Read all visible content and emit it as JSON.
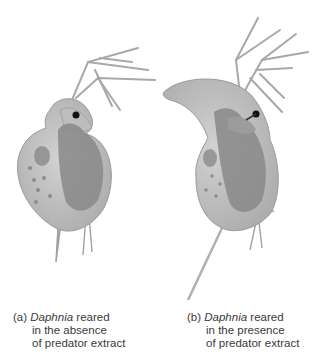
{
  "figure": {
    "panels": [
      {
        "id": "a",
        "label": "(a)",
        "genus": "Daphnia",
        "line1_rest": " reared",
        "line2": "in the absence",
        "line3": "of predator extract",
        "description": "Round-headed Daphnia without helmet, short tail spine"
      },
      {
        "id": "b",
        "label": "(b)",
        "genus": "Daphnia",
        "line1_rest": " reared",
        "line2": "in the presence",
        "line3": "of predator extract",
        "description": "Daphnia with tall pointed helmet and long tail spine"
      }
    ],
    "colors": {
      "body": "#c4c4c4",
      "body_shade": "#9a9a9a",
      "organ": "#7d7d7d",
      "eye": "#111111",
      "antenna": "#a8a8a8"
    }
  }
}
